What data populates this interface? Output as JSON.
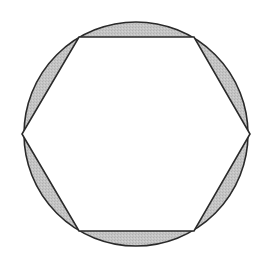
{
  "figure": {
    "circle": {
      "cx": 136,
      "cy": 134,
      "r": 112
    },
    "hexagon": {
      "vertices": [
        [
          79,
          37
        ],
        [
          194,
          37
        ],
        [
          250,
          134
        ],
        [
          194,
          231
        ],
        [
          79,
          231
        ],
        [
          22,
          134
        ]
      ]
    },
    "colors": {
      "background": "#ffffff",
      "stroke": "#2a2a2a",
      "shaded_fill": "#c4c4c4",
      "hexagon_fill": "#ffffff"
    },
    "shaded_region_count": 6
  }
}
